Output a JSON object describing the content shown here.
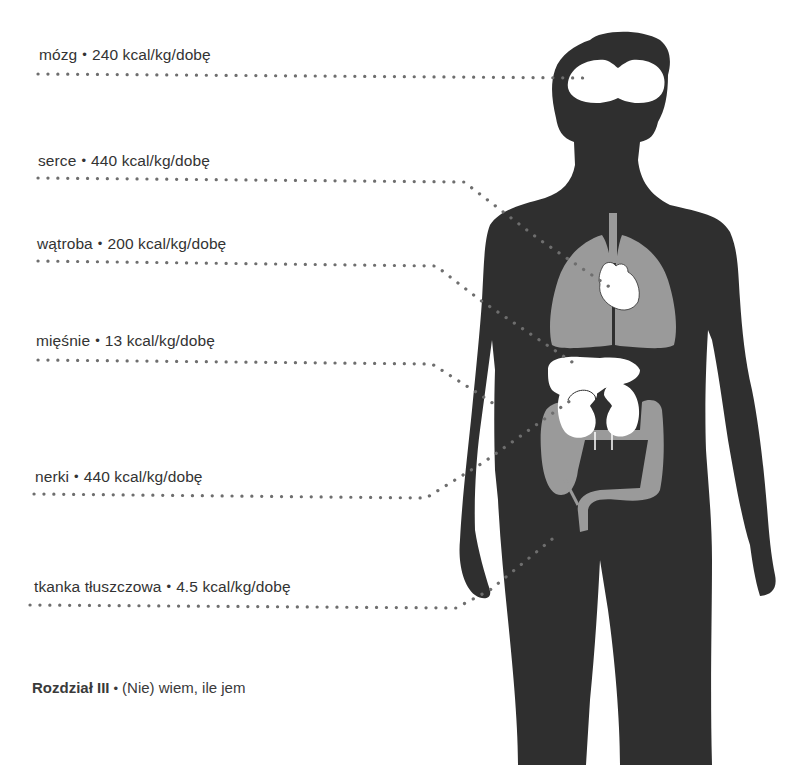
{
  "figure": {
    "unit": "kcal/kg/dobę",
    "organs": [
      {
        "id": "brain",
        "name": "mózg",
        "value": "240",
        "unit": "kcal/kg/dobę"
      },
      {
        "id": "heart",
        "name": "serce",
        "value": "440",
        "unit": "kcal/kg/dobę"
      },
      {
        "id": "liver",
        "name": "wątroba",
        "value": "200",
        "unit": "kcal/kg/dobę"
      },
      {
        "id": "muscles",
        "name": "mięśnie",
        "value": "13",
        "unit": "kcal/kg/dobę"
      },
      {
        "id": "kidneys",
        "name": "nerki",
        "value": "440",
        "unit": "kcal/kg/dobę"
      },
      {
        "id": "adipose",
        "name": "tkanka tłuszczowa",
        "value": "4.5",
        "unit": "kcal/kg/dobę"
      }
    ],
    "separator": "•",
    "colors": {
      "silhouette": "#2f2f2f",
      "organs_gray": "#9a9a9a",
      "organs_white": "#ffffff",
      "dots": "#6e6e6e",
      "text": "#333333"
    }
  },
  "footer": {
    "chapter": "Rozdział III",
    "separator": "•",
    "title": "(Nie) wiem, ile jem"
  }
}
